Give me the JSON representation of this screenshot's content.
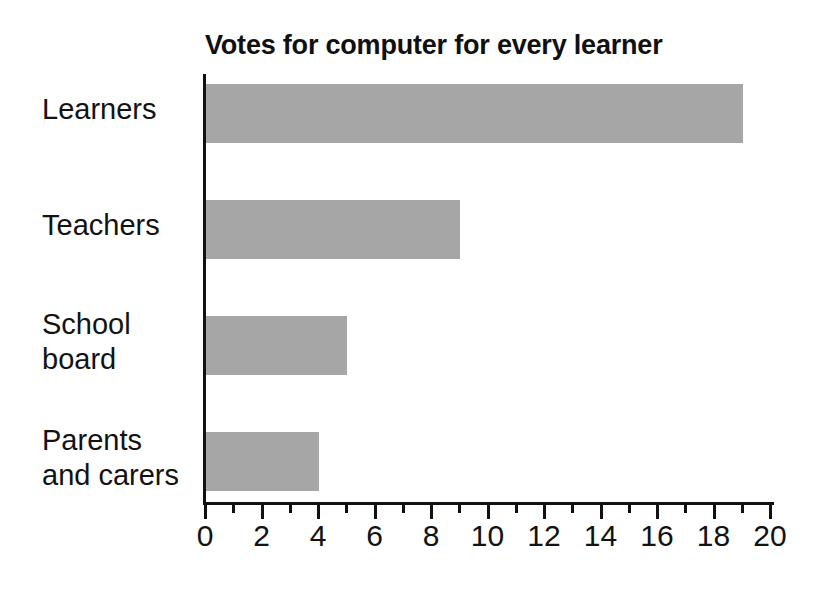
{
  "chart_data": {
    "type": "bar",
    "orientation": "horizontal",
    "title": "Votes for computer for every learner",
    "xlabel": "",
    "ylabel": "",
    "categories": [
      "Learners",
      "Teachers",
      "School board",
      "Parents and carers"
    ],
    "values": [
      19,
      9,
      5,
      4
    ],
    "xlim": [
      0,
      20
    ],
    "xticks": [
      0,
      2,
      4,
      6,
      8,
      10,
      12,
      14,
      16,
      18,
      20
    ],
    "xtick_labels": [
      "0",
      "2",
      "4",
      "6",
      "8",
      "10",
      "12",
      "14",
      "16",
      "18",
      "20"
    ],
    "minor_xticks": [
      1,
      3,
      5,
      7,
      9,
      11,
      13,
      15,
      17,
      19
    ],
    "grid": false,
    "legend": null,
    "bar_color": "#a6a6a6",
    "axis_color": "#111111",
    "text_color": "#121212",
    "background": "#ffffff"
  },
  "axis": {
    "origin_x": 205,
    "baseline_y": 503,
    "px_per_unit": 28.25,
    "bar_height": 59,
    "bar_pitch": 116,
    "first_bar_top": 84
  }
}
